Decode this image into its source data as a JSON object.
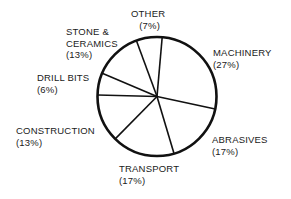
{
  "chart_data": {
    "type": "pie",
    "title": "",
    "start_angle_deg_from_top": 5,
    "direction": "clockwise",
    "categories": [
      "MACHINERY",
      "ABRASIVES",
      "TRANSPORT",
      "CONSTRUCTION",
      "DRILL BITS",
      "STONE & CERAMICS",
      "OTHER"
    ],
    "values": [
      27,
      17,
      17,
      13,
      6,
      13,
      7
    ],
    "value_labels": [
      "(27%)",
      "(17%)",
      "(17%)",
      "(13%)",
      "(6%)",
      "(13%)",
      "(7%)"
    ],
    "legend": "none",
    "style": {
      "fill": "#ffffff",
      "stroke": "#111111"
    }
  },
  "labels": {
    "machinery": {
      "name": "MACHINERY",
      "pct": "(27%)"
    },
    "abrasives": {
      "name": "ABRASIVES",
      "pct": "(17%)"
    },
    "transport": {
      "name": "TRANSPORT",
      "pct": "(17%)"
    },
    "construction": {
      "name": "CONSTRUCTION",
      "pct": "(13%)"
    },
    "drill_bits": {
      "name": "DRILL BITS",
      "pct": "(6%)"
    },
    "stone_ceramics": {
      "name1": "STONE &",
      "name2": "CERAMICS",
      "pct": "(13%)"
    },
    "other": {
      "name": "OTHER",
      "pct": "(7%)"
    }
  }
}
